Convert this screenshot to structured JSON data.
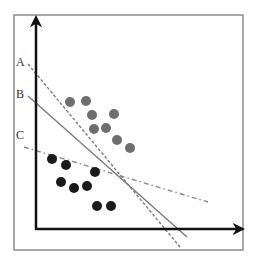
{
  "diagram": {
    "title": "",
    "frame": {
      "x": 14,
      "y": 15,
      "w": 229,
      "h": 235,
      "color": "#8c8c8c"
    },
    "axes": {
      "origin": [
        36,
        229
      ],
      "y_top": [
        36,
        20
      ],
      "x_right": [
        240,
        229
      ],
      "color": "#111111"
    },
    "lines": [
      {
        "id": "A",
        "label": "A",
        "style": "dashed",
        "color": "#7a7a7a",
        "from": [
          28,
          64
        ],
        "to": [
          180,
          247
        ],
        "label_pos": [
          16,
          66
        ]
      },
      {
        "id": "B",
        "label": "B",
        "style": "solid",
        "color": "#7a7a7a",
        "from": [
          28,
          96
        ],
        "to": [
          187,
          237
        ],
        "label_pos": [
          16,
          98
        ]
      },
      {
        "id": "C",
        "label": "C",
        "style": "dash-dot",
        "color": "#8a8a8a",
        "from": [
          24,
          147
        ],
        "to": [
          208,
          202
        ],
        "label_pos": [
          16,
          139
        ]
      }
    ],
    "classes": [
      {
        "name": "gray-points",
        "color": "#6e6e6e",
        "points": [
          [
            70,
            102
          ],
          [
            86,
            101
          ],
          [
            92,
            115
          ],
          [
            114,
            114
          ],
          [
            94,
            129
          ],
          [
            106,
            128
          ],
          [
            117,
            140
          ],
          [
            130,
            148
          ]
        ]
      },
      {
        "name": "dark-points",
        "color": "#1a1a1a",
        "points": [
          [
            52,
            159
          ],
          [
            66,
            165
          ],
          [
            95,
            172
          ],
          [
            61,
            182
          ],
          [
            74,
            188
          ],
          [
            87,
            186
          ],
          [
            97,
            206
          ],
          [
            111,
            206
          ]
        ]
      }
    ],
    "point_radius": 5
  }
}
